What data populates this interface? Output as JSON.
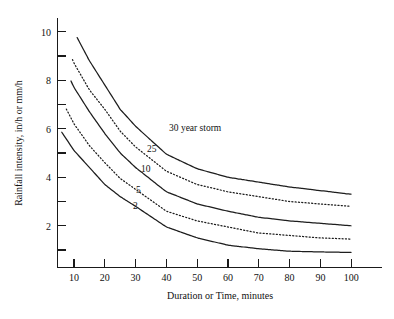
{
  "chart_data": {
    "type": "line",
    "title": "",
    "xlabel": "Duration or Time, minutes",
    "ylabel": "Rainfall intensity, in/h or mm/h",
    "xlim": [
      0,
      110
    ],
    "ylim": [
      0,
      11
    ],
    "xticks": [
      10,
      20,
      30,
      40,
      50,
      60,
      70,
      80,
      90,
      100
    ],
    "xticklabels": [
      "10",
      "20",
      "30",
      "40",
      "50",
      "60",
      "70",
      "80",
      "90",
      "100"
    ],
    "yticks": [
      1,
      2,
      3,
      4,
      5,
      6,
      7,
      8,
      9,
      10
    ],
    "yticklabels": [
      "",
      "2",
      "",
      "4",
      "",
      "6",
      "",
      "8",
      "",
      "10"
    ],
    "grid": false,
    "legend": "inline-curve-labels",
    "x": [
      10,
      15,
      20,
      25,
      30,
      40,
      50,
      60,
      70,
      80,
      90,
      100
    ],
    "series": [
      {
        "name": "30 year storm",
        "label": "30 year storm",
        "style": "solid",
        "x_start": 11,
        "values": [
          10.0,
          8.8,
          7.8,
          6.8,
          6.1,
          4.95,
          4.35,
          4.0,
          3.8,
          3.6,
          3.45,
          3.3
        ]
      },
      {
        "name": "25",
        "label": "25",
        "style": "dotted",
        "x_start": 9.5,
        "values": [
          8.7,
          7.6,
          6.8,
          5.9,
          5.25,
          4.25,
          3.7,
          3.4,
          3.2,
          3.0,
          2.9,
          2.8
        ]
      },
      {
        "name": "10",
        "label": "10",
        "style": "solid",
        "x_start": 9,
        "values": [
          7.7,
          6.7,
          5.8,
          5.0,
          4.4,
          3.4,
          2.9,
          2.6,
          2.35,
          2.2,
          2.1,
          2.0
        ]
      },
      {
        "name": "5",
        "label": "5",
        "style": "dotted",
        "x_start": 7.5,
        "values": [
          6.2,
          5.3,
          4.6,
          3.95,
          3.5,
          2.6,
          2.2,
          1.95,
          1.7,
          1.6,
          1.5,
          1.45
        ]
      },
      {
        "name": "2",
        "label": "2",
        "style": "solid",
        "x_start": 6,
        "values": [
          5.1,
          4.4,
          3.7,
          3.2,
          2.8,
          1.95,
          1.5,
          1.2,
          1.05,
          0.95,
          0.92,
          0.9
        ]
      }
    ],
    "annotations": [
      {
        "text": "30 year storm",
        "x": 41,
        "y": 5.6
      },
      {
        "text": "25",
        "x": 34,
        "y": 4.7
      },
      {
        "text": "10",
        "x": 32,
        "y": 3.9
      },
      {
        "text": "5",
        "x": 30,
        "y": 3.05
      },
      {
        "text": "2",
        "x": 29,
        "y": 2.4
      }
    ],
    "colors": {
      "axis": "#1a1a1a",
      "curve": "#1d1d1d",
      "background": "#ffffff"
    }
  }
}
